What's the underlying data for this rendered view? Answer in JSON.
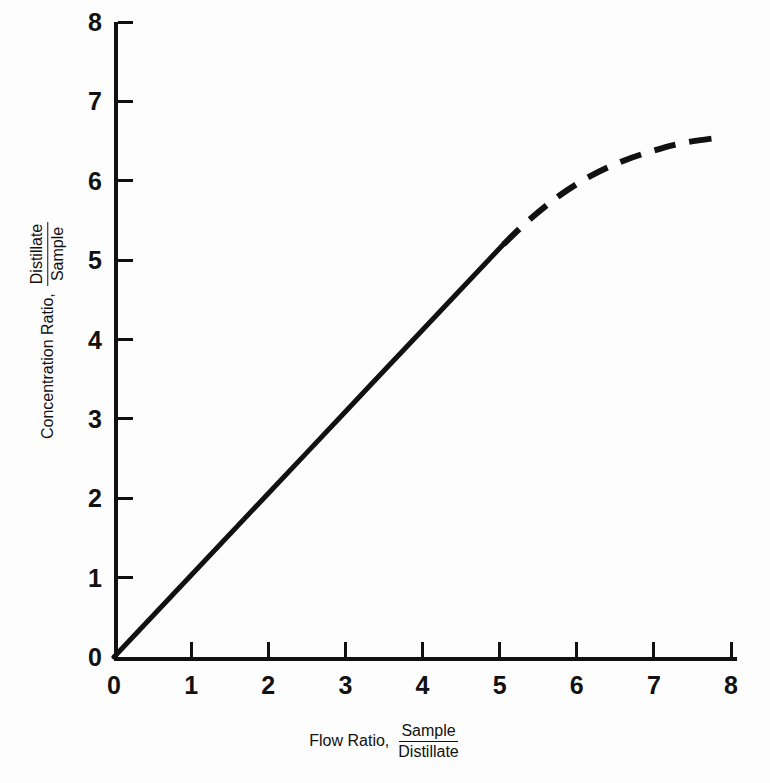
{
  "chart_data": {
    "type": "line",
    "title": "",
    "xlabel_prefix": "Flow Ratio,",
    "xlabel_numerator": "Sample",
    "xlabel_denominator": "Distillate",
    "ylabel_prefix": "Concentration Ratio,",
    "ylabel_numerator": "Distillate",
    "ylabel_denominator": "Sample",
    "xlim": [
      0,
      8
    ],
    "ylim": [
      0,
      8
    ],
    "xticks": [
      "0",
      "1",
      "2",
      "3",
      "4",
      "5",
      "6",
      "7",
      "8"
    ],
    "yticks": [
      "0",
      "1",
      "2",
      "3",
      "4",
      "5",
      "6",
      "7",
      "8"
    ],
    "grid": false,
    "legend": "none",
    "series": [
      {
        "name": "measured-region",
        "style": "solid",
        "x": [
          0.0,
          1.0,
          2.0,
          3.0,
          4.0,
          5.05
        ],
        "y": [
          0.0,
          1.03,
          2.06,
          3.09,
          4.12,
          5.2
        ]
      },
      {
        "name": "extrapolated-region",
        "style": "dashed",
        "x": [
          5.05,
          5.4,
          5.8,
          6.2,
          6.6,
          7.0,
          7.4,
          7.9
        ],
        "y": [
          5.2,
          5.52,
          5.83,
          6.07,
          6.25,
          6.38,
          6.48,
          6.55
        ]
      }
    ],
    "annotations": []
  },
  "caption": {
    "text": ""
  },
  "colors": {
    "ink": "#111111",
    "background": "#fdfdfd"
  }
}
